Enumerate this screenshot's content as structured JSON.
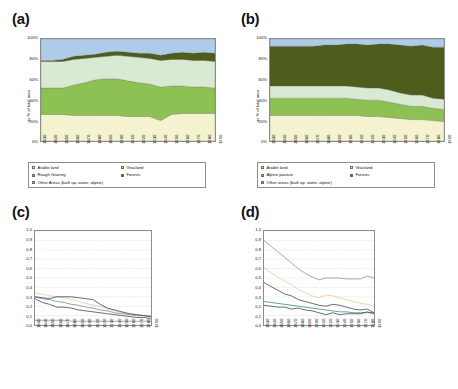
{
  "figure": {
    "panels": [
      "(a)",
      "(b)",
      "(c)",
      "(d)"
    ],
    "years": [
      "1830",
      "1840",
      "1850",
      "1860",
      "1870",
      "1880",
      "1890",
      "1900",
      "1910",
      "1920",
      "1930",
      "1940",
      "1950",
      "1960",
      "1970",
      "1980",
      "1990"
    ],
    "ylabel_area": "as % of total area",
    "yticks_area": [
      "0%",
      "20%",
      "40%",
      "60%",
      "80%",
      "100%"
    ],
    "yticks_index": [
      "0,0",
      "0,1",
      "0,2",
      "0,3",
      "0,4",
      "0,5",
      "0,6",
      "0,7",
      "0,8",
      "0,9",
      "1,0"
    ],
    "labels": {
      "arable": "Arable land",
      "grasland": "Grasland",
      "rough": "Rough Grazing",
      "alpine": "Alpine pasture",
      "forests": "Forests",
      "other_a": "Other Areas (built up, water, alpine)",
      "other_b": "Other areas (built up, water, alpine)",
      "other_c": "Other Areas (built up,\nwater, alpine)",
      "other_d": "Other areas (built up,\nwater, alpine)"
    },
    "colors": {
      "arable": "#f5f2cf",
      "grasland": "#d9ead3",
      "rough": "#8dc153",
      "alpine": "#8dc153",
      "forests": "#4c5d1c",
      "other": "#aecbe8",
      "line_arable": "#f0c089",
      "line_grasland": "#3d3347",
      "line_rough": "#5e8d8d",
      "line_alpine": "#2f7f72",
      "line_forests": "#7f8f97",
      "line_other": "#2b3b45",
      "grid": "#9aa7c4",
      "axis": "#8d8d8d"
    }
  },
  "chart_data": [
    {
      "type": "area",
      "panel": "(a)",
      "title": "",
      "xlabel": "",
      "ylabel": "as % of total area",
      "ylim": [
        0,
        100
      ],
      "grid": false,
      "legend_position": "below",
      "x": [
        "1830",
        "1840",
        "1850",
        "1860",
        "1870",
        "1880",
        "1890",
        "1900",
        "1910",
        "1920",
        "1930",
        "1940",
        "1950",
        "1960",
        "1970",
        "1980",
        "1990"
      ],
      "series": [
        {
          "name": "Arable land",
          "values": [
            26,
            26,
            26,
            25,
            25,
            25,
            25,
            25,
            24,
            24,
            24,
            20,
            26,
            27,
            27,
            27,
            27
          ]
        },
        {
          "name": "Rough Grazing",
          "values": [
            26,
            26,
            26,
            30,
            32,
            35,
            36,
            36,
            35,
            33,
            32,
            33,
            28,
            27,
            26,
            26,
            25
          ]
        },
        {
          "name": "Grasland",
          "values": [
            26,
            26,
            26,
            25,
            24,
            22,
            22,
            23,
            24,
            25,
            25,
            26,
            26,
            26,
            26,
            26,
            26
          ]
        },
        {
          "name": "Forests",
          "values": [
            1,
            1,
            2,
            3,
            3,
            3,
            4,
            4,
            4,
            4,
            5,
            5,
            6,
            7,
            7,
            8,
            8
          ]
        },
        {
          "name": "Other Areas (built up, water, alpine)",
          "values": [
            21,
            21,
            20,
            17,
            16,
            15,
            13,
            12,
            13,
            14,
            14,
            16,
            14,
            13,
            14,
            13,
            14
          ]
        }
      ]
    },
    {
      "type": "area",
      "panel": "(b)",
      "title": "",
      "xlabel": "",
      "ylabel": "as % of total area",
      "ylim": [
        0,
        100
      ],
      "grid": false,
      "legend_position": "below",
      "x": [
        "1830",
        "1840",
        "1850",
        "1860",
        "1870",
        "1880",
        "1890",
        "1900",
        "1910",
        "1920",
        "1930",
        "1940",
        "1950",
        "1960",
        "1970",
        "1980",
        "1990"
      ],
      "series": [
        {
          "name": "Arable land",
          "values": [
            25,
            25,
            25,
            25,
            25,
            25,
            25,
            25,
            25,
            24,
            24,
            23,
            22,
            21,
            21,
            20,
            19
          ]
        },
        {
          "name": "Alpine pasture",
          "values": [
            17,
            17,
            17,
            17,
            17,
            17,
            17,
            17,
            16,
            16,
            16,
            15,
            14,
            13,
            13,
            12,
            12
          ]
        },
        {
          "name": "Grasland",
          "values": [
            12,
            12,
            12,
            12,
            12,
            12,
            12,
            12,
            12,
            12,
            12,
            12,
            11,
            11,
            11,
            10,
            10
          ]
        },
        {
          "name": "Forests",
          "values": [
            39,
            39,
            39,
            39,
            39,
            40,
            40,
            41,
            42,
            42,
            43,
            45,
            47,
            48,
            49,
            50,
            51
          ]
        },
        {
          "name": "Other areas (built up, water, alpine)",
          "values": [
            7,
            7,
            7,
            7,
            7,
            6,
            6,
            5,
            5,
            6,
            5,
            5,
            6,
            7,
            6,
            8,
            8
          ]
        }
      ]
    },
    {
      "type": "line",
      "panel": "(c)",
      "title": "",
      "xlabel": "",
      "ylabel": "",
      "ylim": [
        0.0,
        1.0
      ],
      "grid": true,
      "legend_position": "right",
      "x": [
        "1830",
        "1840",
        "1850",
        "1860",
        "1870",
        "1880",
        "1890",
        "1900",
        "1910",
        "1920",
        "1930",
        "1940",
        "1950",
        "1960",
        "1970",
        "1980",
        "1990"
      ],
      "series": [
        {
          "name": "Arable land",
          "values": [
            0.34,
            0.33,
            0.31,
            0.3,
            0.29,
            0.27,
            0.25,
            0.23,
            0.21,
            0.2,
            0.17,
            0.15,
            0.13,
            0.12,
            0.11,
            0.1,
            0.1
          ]
        },
        {
          "name": "Grasland",
          "values": [
            0.28,
            0.24,
            0.22,
            0.19,
            0.19,
            0.18,
            0.16,
            0.15,
            0.14,
            0.13,
            0.12,
            0.11,
            0.1,
            0.09,
            0.08,
            0.08,
            0.07
          ]
        },
        {
          "name": "Rough Grazing",
          "values": [
            0.3,
            0.28,
            0.27,
            0.25,
            0.24,
            0.22,
            0.21,
            0.19,
            0.18,
            0.16,
            0.15,
            0.13,
            0.12,
            0.11,
            0.1,
            0.1,
            0.09
          ]
        },
        {
          "name": "Forests",
          "values": [
            0.05,
            0.05,
            0.05,
            0.05,
            0.05,
            0.04,
            0.04,
            0.04,
            0.04,
            0.04,
            0.04,
            0.04,
            0.04,
            0.04,
            0.04,
            0.04,
            0.04
          ]
        },
        {
          "name": "Other Areas (built up, water, alpine)",
          "values": [
            0.3,
            0.29,
            0.28,
            0.3,
            0.3,
            0.3,
            0.29,
            0.28,
            0.27,
            0.22,
            0.18,
            0.16,
            0.14,
            0.12,
            0.11,
            0.1,
            0.09
          ]
        }
      ]
    },
    {
      "type": "line",
      "panel": "(d)",
      "title": "",
      "xlabel": "",
      "ylabel": "",
      "ylim": [
        0.0,
        1.0
      ],
      "grid": true,
      "legend_position": "right",
      "x": [
        "1830",
        "1840",
        "1850",
        "1860",
        "1870",
        "1880",
        "1890",
        "1900",
        "1910",
        "1920",
        "1930",
        "1940",
        "1950",
        "1960",
        "1970",
        "1980",
        "1990"
      ],
      "series": [
        {
          "name": "Arable land",
          "values": [
            0.61,
            0.56,
            0.51,
            0.47,
            0.43,
            0.38,
            0.34,
            0.31,
            0.29,
            0.32,
            0.31,
            0.29,
            0.27,
            0.25,
            0.23,
            0.22,
            0.2
          ]
        },
        {
          "name": "Grasland",
          "values": [
            0.45,
            0.41,
            0.37,
            0.33,
            0.31,
            0.27,
            0.25,
            0.23,
            0.21,
            0.2,
            0.22,
            0.21,
            0.19,
            0.17,
            0.16,
            0.17,
            0.13
          ]
        },
        {
          "name": "Alpine pasture",
          "values": [
            0.25,
            0.24,
            0.23,
            0.22,
            0.21,
            0.2,
            0.19,
            0.18,
            0.17,
            0.16,
            0.15,
            0.14,
            0.14,
            0.13,
            0.13,
            0.13,
            0.13
          ]
        },
        {
          "name": "Forests",
          "values": [
            0.9,
            0.84,
            0.78,
            0.72,
            0.66,
            0.6,
            0.55,
            0.51,
            0.48,
            0.5,
            0.5,
            0.5,
            0.49,
            0.49,
            0.49,
            0.52,
            0.5
          ]
        },
        {
          "name": "Other areas (built up, water, alpine)",
          "values": [
            0.21,
            0.2,
            0.19,
            0.19,
            0.17,
            0.18,
            0.16,
            0.15,
            0.13,
            0.11,
            0.13,
            0.11,
            0.12,
            0.12,
            0.12,
            0.14,
            0.12
          ]
        }
      ]
    }
  ]
}
